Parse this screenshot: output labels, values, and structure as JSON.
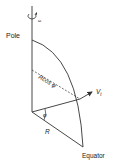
{
  "diagram": {
    "labels": {
      "pole": "Pole",
      "equator": "Equator",
      "radius": "R",
      "projected_radius": "Rcos φ",
      "angle": "φ",
      "tangential_velocity": "V",
      "tangential_velocity_subscript": "t",
      "rotation": "ω"
    },
    "colors": {
      "stroke": "#333333",
      "text": "#222222",
      "background": "#ffffff"
    }
  }
}
